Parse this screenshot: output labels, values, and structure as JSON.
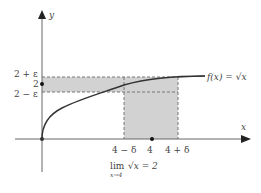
{
  "diagram": {
    "axes": {
      "x_label": "x",
      "y_label": "y"
    },
    "function_label": "f(x) = √x",
    "y_ticks": [
      {
        "label": "2 + ε",
        "value": "2+epsilon"
      },
      {
        "label": "2",
        "value": 2
      },
      {
        "label": "2 − ε",
        "value": "2-epsilon"
      }
    ],
    "x_ticks": [
      {
        "label": "4 − δ",
        "value": "4-delta"
      },
      {
        "label": "4",
        "value": 4
      },
      {
        "label": "4 + δ",
        "value": "4+delta"
      }
    ],
    "limit_expression": {
      "lim": "lim",
      "under": "x→4",
      "body": "√x = 2"
    },
    "colors": {
      "shade": "#cfcfcf",
      "axis": "#555555",
      "curve": "#333333",
      "dash": "#777777"
    }
  }
}
